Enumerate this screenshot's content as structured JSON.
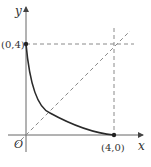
{
  "diagram": {
    "type": "function-graph",
    "axes": {
      "x_label": "x",
      "y_label": "y",
      "origin_label": "O"
    },
    "points": [
      {
        "label": "(0,4)",
        "x": 0,
        "y": 4
      },
      {
        "label": "(4,0)",
        "x": 4,
        "y": 0
      }
    ],
    "curve": {
      "description": "decreasing concave-up curve from (0,4) to (4,0)",
      "style": "solid"
    },
    "guides": [
      {
        "description": "line y = x",
        "style": "dashed"
      },
      {
        "description": "horizontal line y = 4",
        "style": "dashed"
      },
      {
        "description": "vertical line x = 4",
        "style": "dashed"
      }
    ],
    "colors": {
      "curve": "#2a2a2a",
      "axes": "#555555",
      "dashed": "#8a8a8a",
      "labels": "#333333"
    }
  }
}
